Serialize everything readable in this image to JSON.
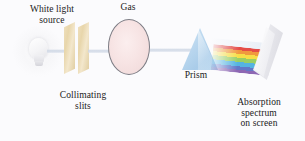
{
  "figure": {
    "background_color": "#fbfbfd"
  },
  "labels": {
    "source": "White light\nsource",
    "slits": "Collimating\nslits",
    "gas": "Gas",
    "prism": "Prism",
    "screen": "Absorption\nspectrum\non screen"
  },
  "components": {
    "light_bulb": "light-bulb-icon",
    "collimating_slits": "slit-plates",
    "gas_cell": "gas-cell-ellipse",
    "prism": "triangular-prism",
    "screen": "projection-screen",
    "beam": "light-beam"
  },
  "colors": {
    "gas_fill": "#f7e4e4",
    "gas_outline": "#7d7d85",
    "slit_fill": "#e8d6ab",
    "prism_fill": "#bcd8ef",
    "beam": "#cdd6e4",
    "screen_fill": "#e9e9ee",
    "label_text": "#1a1a1a"
  },
  "chart_data": {
    "type": "diagram",
    "spectrum_bands": [
      {
        "name": "red",
        "color": "#e4322b",
        "start_pct": 0,
        "end_pct": 13
      },
      {
        "name": "orange",
        "color": "#ef8a1f",
        "start_pct": 13,
        "end_pct": 27
      },
      {
        "name": "yellow",
        "color": "#f6d92a",
        "start_pct": 27,
        "end_pct": 42
      },
      {
        "name": "green",
        "color": "#8cc84b",
        "start_pct": 42,
        "end_pct": 58
      },
      {
        "name": "cyan",
        "color": "#3aa9dd",
        "start_pct": 58,
        "end_pct": 75
      },
      {
        "name": "blue",
        "color": "#4a63c0",
        "start_pct": 75,
        "end_pct": 88
      },
      {
        "name": "violet",
        "color": "#7b4fa8",
        "start_pct": 88,
        "end_pct": 100
      }
    ],
    "optical_path": [
      "White light source",
      "Collimating slits",
      "Gas",
      "Prism",
      "Absorption spectrum on screen"
    ]
  }
}
